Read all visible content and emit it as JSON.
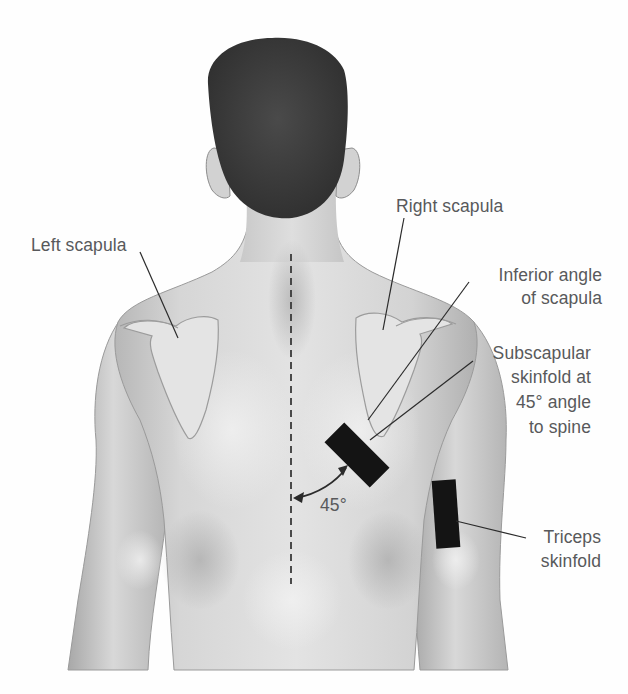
{
  "figure": {
    "colors": {
      "background": "#fefefe",
      "skin_light": "#e9e9e9",
      "skin_mid": "#c9c9c9",
      "skin_shadow": "#a9a9a9",
      "hair": "#3f3f3f",
      "caliper_marker": "#141414",
      "label_text": "#58595b",
      "leader_line": "#2b2b2b"
    }
  },
  "labels": {
    "left_scapula": "Left scapula",
    "right_scapula": "Right scapula",
    "inferior_angle_line1": "Inferior angle",
    "inferior_angle_line2": "of scapula",
    "subscapular_line1": "Subscapular",
    "subscapular_line2": "skinfold at",
    "subscapular_line3": "45° angle",
    "subscapular_line4": "to spine",
    "angle": "45°",
    "triceps_line1": "Triceps",
    "triceps_line2": "skinfold"
  },
  "markers": [
    {
      "name": "subscapular-skinfold-site",
      "orientation_deg": 45
    },
    {
      "name": "triceps-skinfold-site",
      "orientation_deg": 0
    }
  ],
  "reference_lines": [
    {
      "name": "spine-midline",
      "style": "dashed"
    }
  ]
}
